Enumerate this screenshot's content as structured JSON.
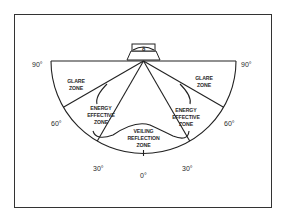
{
  "diagram": {
    "angle_labels": {
      "left_90": "90°",
      "right_90": "90°",
      "left_60": "60°",
      "right_60": "60°",
      "left_30": "30°",
      "right_30": "30°",
      "bottom_0": "0°"
    },
    "zones": {
      "glare_left": [
        "GLARE",
        "ZONE"
      ],
      "glare_right": [
        "GLARE",
        "ZONE"
      ],
      "energy_left": [
        "ENERGY",
        "EFFECTIVE",
        "ZONE"
      ],
      "energy_right": [
        "ENERGY",
        "EFFECTIVE",
        "ZONE"
      ],
      "veiling": [
        "VEILING",
        "REFLECTION",
        "ZONE"
      ]
    },
    "luminaire_glyph": "8",
    "colors": {
      "line": "#222222",
      "text": "#2a2a2a",
      "background": "#ffffff"
    }
  }
}
